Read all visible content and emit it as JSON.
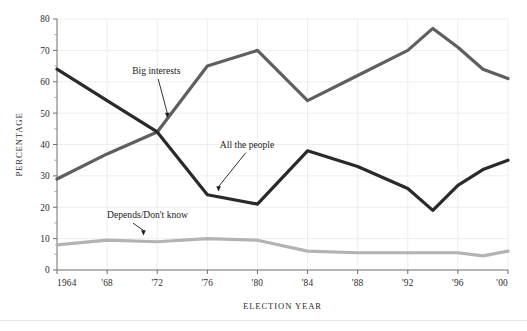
{
  "chart_data": {
    "type": "line",
    "title": "",
    "xlabel": "ELECTION YEAR",
    "ylabel": "PERCENTAGE",
    "x": [
      1964,
      1968,
      1972,
      1976,
      1980,
      1984,
      1988,
      1992,
      1994,
      1996,
      1998,
      2000
    ],
    "xtick_labels": [
      "1964",
      "'68",
      "'72",
      "'76",
      "'80",
      "'84",
      "'88",
      "'92",
      "'96",
      "'00"
    ],
    "xtick_values": [
      1964,
      1968,
      1972,
      1976,
      1980,
      1984,
      1988,
      1992,
      1996,
      2000
    ],
    "ytick_labels": [
      "0",
      "10",
      "20",
      "30",
      "40",
      "50",
      "60",
      "70",
      "80"
    ],
    "ytick_values": [
      0,
      10,
      20,
      30,
      40,
      50,
      60,
      70,
      80
    ],
    "xlim": [
      1964,
      2000
    ],
    "ylim": [
      0,
      80
    ],
    "grid": true,
    "legend_position": "inline-annotations",
    "series": [
      {
        "name": "Big interests",
        "color": "#5f5f5f",
        "x": [
          1964,
          1968,
          1972,
          1976,
          1980,
          1984,
          1988,
          1992,
          1994,
          1996,
          1998,
          2000
        ],
        "values": [
          29,
          37,
          44,
          65,
          70,
          54,
          62,
          70,
          77,
          71,
          64,
          61
        ]
      },
      {
        "name": "All the people",
        "color": "#2a2a2a",
        "x": [
          1964,
          1968,
          1972,
          1976,
          1980,
          1984,
          1988,
          1992,
          1994,
          1996,
          1998,
          2000
        ],
        "values": [
          64,
          54,
          44,
          24,
          21,
          38,
          33,
          26,
          19,
          27,
          32,
          35
        ]
      },
      {
        "name": "Depends/Don't know",
        "color": "#b3b3b3",
        "x": [
          1964,
          1968,
          1972,
          1976,
          1980,
          1984,
          1988,
          1992,
          1994,
          1996,
          1998,
          2000
        ],
        "values": [
          8,
          9.5,
          9,
          10,
          9.5,
          6,
          5.5,
          5.5,
          5.5,
          5.5,
          4.5,
          6
        ]
      }
    ],
    "annotations": [
      {
        "label": "Big interests",
        "text_x": 1970.0,
        "text_y": 62.5,
        "point_x": 1972.8,
        "point_y": 48.5
      },
      {
        "label": "All the people",
        "text_x": 1977.0,
        "text_y": 39.0,
        "point_x": 1976.9,
        "point_y": 25.0
      },
      {
        "label": "Depends/Don't know",
        "text_x": 1968.0,
        "text_y": 16.5,
        "point_x": 1970.9,
        "point_y": 11.0
      }
    ]
  }
}
